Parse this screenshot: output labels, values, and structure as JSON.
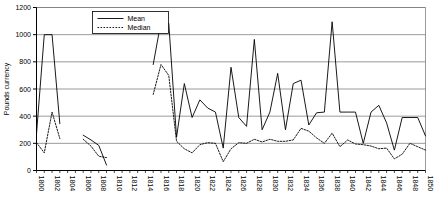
{
  "chart_data": {
    "type": "line",
    "title": "",
    "xlabel": "",
    "ylabel": "Pounds currency",
    "xlim": [
      1800,
      1850
    ],
    "ylim": [
      0,
      1200
    ],
    "yticks": [
      0,
      200,
      400,
      600,
      800,
      1000,
      1200
    ],
    "xticks": [
      1800,
      1802,
      1804,
      1806,
      1808,
      1810,
      1812,
      1814,
      1816,
      1818,
      1820,
      1822,
      1824,
      1826,
      1828,
      1830,
      1832,
      1834,
      1836,
      1838,
      1840,
      1842,
      1844,
      1846,
      1848,
      1850
    ],
    "xtick_labels": [
      "1800",
      "1802",
      "1804",
      "1806",
      "1808",
      "1810",
      "1812",
      "1814",
      "1816",
      "1818",
      "1820",
      "1822",
      "1824",
      "1826",
      "1828",
      "1830",
      "1832",
      "1834",
      "1836",
      "1838",
      "1840",
      "1842",
      "1844",
      "1846",
      "1848",
      "1850"
    ],
    "grid": true,
    "grid_axis": "y",
    "legend": {
      "position": "top-center",
      "entries": [
        {
          "name": "Mean",
          "style": "solid"
        },
        {
          "name": "Median",
          "style": "dotted"
        }
      ]
    },
    "series": [
      {
        "name": "Mean",
        "style": "solid",
        "color": "#000000",
        "segments": [
          {
            "x": [
              1800,
              1801,
              1802,
              1803
            ],
            "y": [
              270,
              1000,
              1000,
              345
            ]
          },
          {
            "x": [
              1806,
              1807,
              1808,
              1809
            ],
            "y": [
              260,
              225,
              185,
              40
            ]
          },
          {
            "x": [
              1815,
              1816,
              1817,
              1818,
              1819,
              1820,
              1821,
              1822,
              1823,
              1824,
              1825,
              1826,
              1827,
              1828,
              1829,
              1830,
              1831,
              1832,
              1833,
              1834,
              1835,
              1836,
              1837,
              1838,
              1839,
              1840,
              1841,
              1842,
              1843,
              1844,
              1845,
              1846,
              1847,
              1848,
              1849,
              1850
            ],
            "y": [
              780,
              1095,
              1085,
              245,
              640,
              390,
              520,
              460,
              430,
              165,
              760,
              390,
              325,
              965,
              300,
              430,
              715,
              300,
              640,
              665,
              335,
              425,
              430,
              1095,
              430,
              430,
              430,
              200,
              430,
              480,
              350,
              150,
              390,
              390,
              390,
              255
            ]
          }
        ]
      },
      {
        "name": "Median",
        "style": "dotted",
        "color": "#000000",
        "segments": [
          {
            "x": [
              1800,
              1801,
              1802,
              1803
            ],
            "y": [
              205,
              130,
              430,
              235
            ]
          },
          {
            "x": [
              1806,
              1807,
              1808,
              1809
            ],
            "y": [
              230,
              180,
              105,
              95
            ]
          },
          {
            "x": [
              1815,
              1816,
              1817,
              1818,
              1819,
              1820,
              1821,
              1822,
              1823,
              1824,
              1825,
              1826,
              1827,
              1828,
              1829,
              1830,
              1831,
              1832,
              1833,
              1834,
              1835,
              1836,
              1837,
              1838,
              1839,
              1840,
              1841,
              1842,
              1843,
              1844,
              1845,
              1846,
              1847,
              1848,
              1849,
              1850
            ],
            "y": [
              560,
              780,
              700,
              215,
              160,
              130,
              190,
              205,
              200,
              65,
              160,
              205,
              200,
              230,
              210,
              230,
              215,
              215,
              225,
              310,
              290,
              240,
              200,
              275,
              175,
              225,
              195,
              190,
              180,
              160,
              165,
              85,
              120,
              200,
              175,
              150
            ]
          }
        ]
      }
    ]
  },
  "axis": {
    "ylabel": "Pounds currency"
  }
}
